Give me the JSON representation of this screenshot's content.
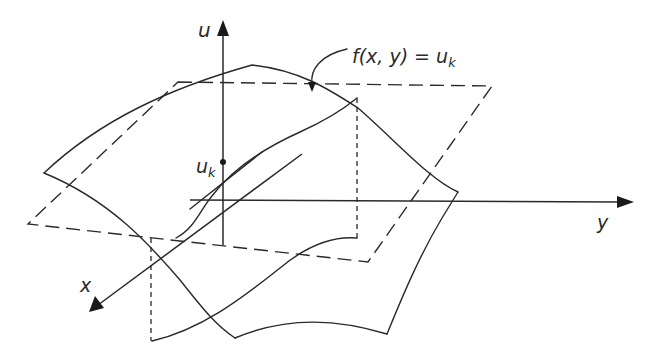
{
  "diagram": {
    "axes": {
      "u_label": "u",
      "x_label": "x",
      "y_label": "y"
    },
    "level_value_label": "u",
    "level_value_subscript": "k",
    "contour_label_prefix": "f(x, y) = u",
    "contour_label_subscript": "k"
  },
  "colors": {
    "stroke": "#2a2a2a",
    "background": "#ffffff"
  }
}
